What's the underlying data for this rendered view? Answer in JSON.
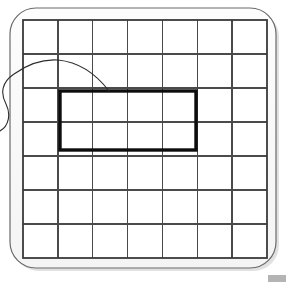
{
  "figure": {
    "background_color": "#ffffff",
    "width": 288,
    "height": 286
  },
  "frame": {
    "name": "rounded-frame",
    "x": 10,
    "y": 8,
    "width": 266,
    "height": 260,
    "corner_radius": 26,
    "stroke_color": "#6a6a6a",
    "stroke_width": 1.2,
    "fill_color": "#fbfbfb",
    "shadow_color": "#c9c9c9"
  },
  "grid": {
    "name": "cell-grid",
    "columns": 7,
    "rows": 7,
    "x": 23,
    "y": 20,
    "width": 244,
    "height": 238,
    "cell_width": 34.86,
    "cell_height": 34.0,
    "line_color": "#4a4a4a",
    "line_width": 1.5,
    "border_color": "#3a3a3a",
    "border_width": 1.8,
    "fill_color": "#ffffff"
  },
  "highlight_rect": {
    "name": "selected-region",
    "label": "4 x 2 cell block",
    "col_start": 1,
    "col_end": 5,
    "row_start": 2,
    "row_end": 4,
    "x": 60,
    "y": 91,
    "width": 136,
    "height": 59,
    "stroke_color": "#0d0d0d",
    "stroke_width": 3.4,
    "fill": "none"
  },
  "pointer_curve": {
    "name": "annotation-arc",
    "description": "thin hand-drawn arc sweeping from the left margin over the grid down to the top edge of the highlighted region",
    "stroke_color": "#2b2b2b",
    "stroke_width": 1.1,
    "fill": "none",
    "path": "M 0 131 C 9 126 11 114 6 104 C 0 93 2 82 14 74 C 28 64 44 59 58 60 C 78 62 96 74 109 91"
  },
  "corner_mark": {
    "name": "corner-artifact",
    "x": 268,
    "y": 275,
    "width": 18,
    "height": 7,
    "color": "#b4b4b4"
  }
}
